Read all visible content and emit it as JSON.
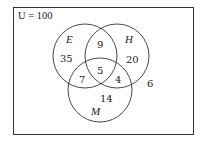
{
  "diagram": {
    "type": "venn-3",
    "universe_label": "U = 100",
    "universe_total": 100,
    "sets": [
      {
        "key": "E",
        "label": "E"
      },
      {
        "key": "H",
        "label": "H"
      },
      {
        "key": "M",
        "label": "M"
      }
    ],
    "regions": {
      "E_only": "35",
      "H_only": "20",
      "M_only": "14",
      "E_H_only": "9",
      "E_M_only": "7",
      "H_M_only": "4",
      "E_H_M": "5",
      "outside": "6"
    }
  }
}
